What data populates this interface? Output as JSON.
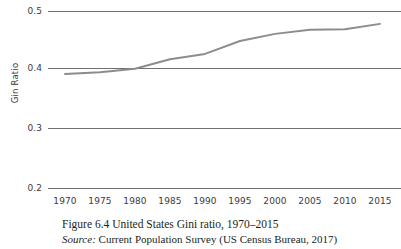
{
  "chart_data": {
    "type": "line",
    "title": "",
    "xlabel": "",
    "ylabel": "Gin Ratio",
    "x": [
      1970,
      1975,
      1980,
      1985,
      1990,
      1995,
      2000,
      2005,
      2010,
      2015
    ],
    "categories": [
      "1970",
      "1975",
      "1980",
      "1985",
      "1990",
      "1995",
      "2000",
      "2005",
      "2010",
      "2015"
    ],
    "values": [
      0.394,
      0.397,
      0.403,
      0.419,
      0.428,
      0.45,
      0.462,
      0.469,
      0.47,
      0.479
    ],
    "series": [
      {
        "name": "US Gini ratio",
        "values": [
          0.394,
          0.397,
          0.403,
          0.419,
          0.428,
          0.45,
          0.462,
          0.469,
          0.47,
          0.479
        ]
      }
    ],
    "ylim": [
      0.2,
      0.5
    ],
    "xlim": [
      1970,
      2015
    ],
    "y_ticks": [
      0.5,
      0.4,
      0.3,
      0.2
    ],
    "y_tick_labels": [
      "0.5",
      "0.4",
      "0.3",
      "0.2"
    ],
    "x_ticks": [
      1970,
      1975,
      1980,
      1985,
      1990,
      1995,
      2000,
      2005,
      2010,
      2015
    ],
    "grid": true,
    "grid_axis": "y",
    "legend": false,
    "legend_position": "none",
    "line_color": "#8c8c8c",
    "grid_color": "#6f6f6f",
    "text_color": "#3d3a39"
  },
  "axis": {
    "y_title": "Gin Ratio",
    "y_tick_labels": [
      "0.5",
      "0.4",
      "0.3",
      "0.2"
    ],
    "x_tick_labels": [
      "1970",
      "1975",
      "1980",
      "1985",
      "1990",
      "1995",
      "2000",
      "2005",
      "2010",
      "2015"
    ]
  },
  "caption": {
    "title": "Figure 6.4  United States Gini ratio, 1970–2015",
    "source_label": "Source:",
    "source_text": " Current Population Survey (US Census Bureau, 2017)"
  }
}
